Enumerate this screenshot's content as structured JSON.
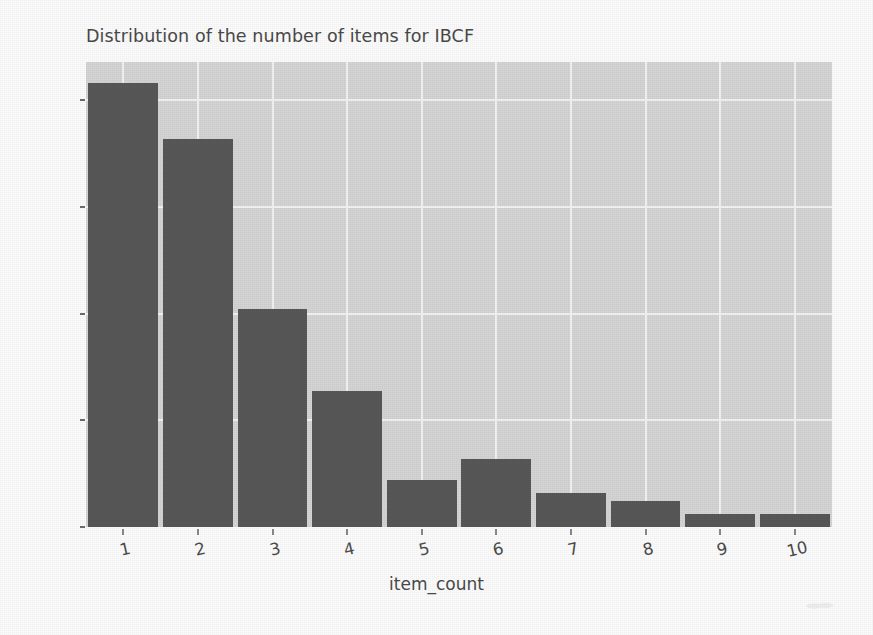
{
  "chart_data": {
    "type": "bar",
    "title": "Distribution of the number of items for IBCF",
    "xlabel": "item_count",
    "ylabel": "",
    "categories": [
      "1",
      "2",
      "3",
      "4",
      "5",
      "6",
      "7",
      "8",
      "9",
      "10"
    ],
    "values": [
      104,
      91,
      51,
      32,
      11,
      16,
      8,
      6,
      3,
      3
    ],
    "ylim": [
      0,
      109
    ],
    "xlim": [
      0.5,
      10.5
    ],
    "yticks": [
      "0",
      "25",
      "50",
      "75",
      "100"
    ],
    "ytick_values": [
      0,
      25,
      50,
      75,
      100
    ],
    "xticks": [
      "1",
      "2",
      "3",
      "4",
      "5",
      "6",
      "7",
      "8",
      "9",
      "10"
    ],
    "grid": true,
    "legend": "none",
    "bar_color": "#585858",
    "plot_background": "#d6d6d6",
    "grid_color": "#f4f4f4",
    "text_color": "#4a4a4a",
    "xtick_rotation": -13
  }
}
